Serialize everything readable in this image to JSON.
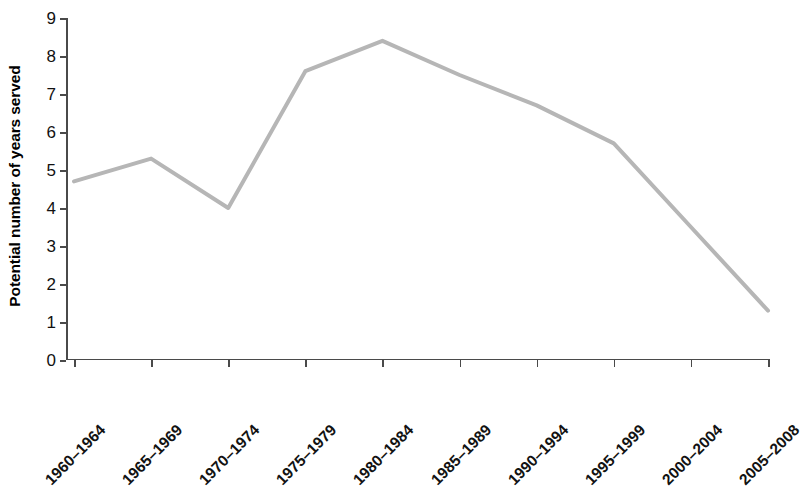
{
  "chart_data": {
    "type": "line",
    "title": "",
    "xlabel": "",
    "ylabel": "Potential number of years served",
    "categories": [
      "1960–1964",
      "1965–1969",
      "1970–1974",
      "1975–1979",
      "1980–1984",
      "1985–1989",
      "1990–1994",
      "1995–1999",
      "2000–2004",
      "2005–2008"
    ],
    "values": [
      4.7,
      5.3,
      4.0,
      7.6,
      8.4,
      7.5,
      6.7,
      5.7,
      3.5,
      1.3
    ],
    "ylim": [
      0,
      9
    ],
    "ytick_labels": [
      "0",
      "1",
      "2",
      "3",
      "4",
      "5",
      "6",
      "7",
      "8",
      "9"
    ],
    "ytick_values": [
      0,
      1,
      2,
      3,
      4,
      5,
      6,
      7,
      8,
      9
    ],
    "grid": false,
    "legend": false,
    "series_color": "#b6b6b6",
    "axis_color": "#4a4a4a",
    "text_color": "#111111"
  }
}
